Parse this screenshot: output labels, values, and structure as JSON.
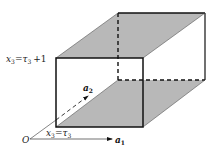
{
  "diagram": {
    "type": "3d-box",
    "fill_color": "#b8b8b8",
    "stroke_color": "#111111",
    "labels": {
      "origin": "O",
      "a1": {
        "base": "a",
        "sub": "1"
      },
      "a2": {
        "base": "a",
        "sub": "2"
      },
      "top_plane": {
        "var": "x",
        "var_sub": "3",
        "eq": "=",
        "tau": "τ",
        "tau_sub": "3",
        "plus": "+1"
      },
      "bottom_plane": {
        "var": "x",
        "var_sub": "3",
        "eq": "=",
        "tau": "τ",
        "tau_sub": "3"
      }
    },
    "shaded_faces": [
      "top",
      "bottom"
    ],
    "dashed_edges": [
      "back-left-vertical",
      "back-bottom",
      "a2-axis"
    ]
  }
}
